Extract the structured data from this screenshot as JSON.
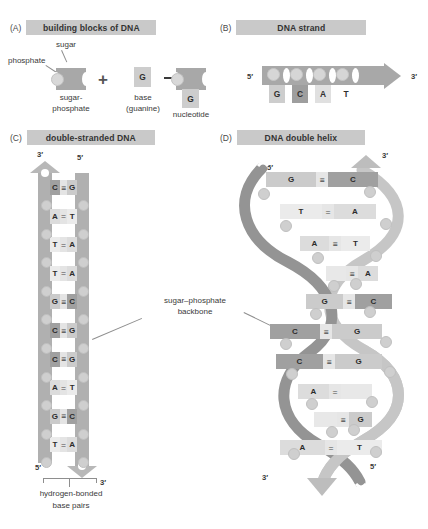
{
  "figure": {
    "panels": [
      {
        "letter": "(A)",
        "title": "building blocks of DNA"
      },
      {
        "letter": "(B)",
        "title": "DNA strand"
      },
      {
        "letter": "(C)",
        "title": "double-stranded DNA"
      },
      {
        "letter": "(D)",
        "title": "DNA double helix"
      }
    ]
  },
  "panelA": {
    "label_phosphate": "phosphate",
    "label_sugar": "sugar",
    "label_sugar_phosphate_line1": "sugar-",
    "label_sugar_phosphate_line2": "phosphate",
    "label_base_line1": "base",
    "label_base_line2": "(guanine)",
    "label_nucleotide": "nucleotide",
    "plus_sign": "+",
    "base_letter": "G",
    "product_base_letter": "G",
    "arrow_icon": "right-arrow-icon"
  },
  "panelB": {
    "five_prime": "5′",
    "three_prime": "3′",
    "bases": [
      "G",
      "C",
      "A",
      "T"
    ],
    "base_shades": [
      "#cdcdcd",
      "#9e9e9e",
      "#e0e0e0",
      "#ffffff"
    ]
  },
  "panelC": {
    "top_left_prime": "3′",
    "top_right_prime": "5′",
    "bottom_left_prime": "5′",
    "bottom_right_prime": "3′",
    "caption_line1": "hydrogen-bonded",
    "caption_line2": "base pairs",
    "base_pairs": [
      {
        "left": "C",
        "bond": "≡",
        "right": "G"
      },
      {
        "left": "A",
        "bond": "=",
        "right": "T"
      },
      {
        "left": "T",
        "bond": "=",
        "right": "A"
      },
      {
        "left": "T",
        "bond": "=",
        "right": "A"
      },
      {
        "left": "G",
        "bond": "≡",
        "right": "C"
      },
      {
        "left": "C",
        "bond": "≡",
        "right": "G"
      },
      {
        "left": "C",
        "bond": "≡",
        "right": "G"
      },
      {
        "left": "A",
        "bond": "=",
        "right": "T"
      },
      {
        "left": "G",
        "bond": "≡",
        "right": "C"
      },
      {
        "left": "T",
        "bond": "=",
        "right": "A"
      }
    ]
  },
  "panelD": {
    "top_left_prime": "5′",
    "top_right_prime": "3′",
    "bottom_left_prime": "3′",
    "bottom_right_prime": "5′",
    "base_pairs": [
      {
        "left": "G",
        "bond": "≡",
        "right": "C"
      },
      {
        "left": "T",
        "bond": "=",
        "right": "A"
      },
      {
        "left": "A",
        "bond": "≡",
        "right": "T"
      },
      {
        "left": "",
        "bond": "≡",
        "right": "A"
      },
      {
        "left": "G",
        "bond": "≡",
        "right": "C"
      },
      {
        "left": "C",
        "bond": "≡",
        "right": "G"
      },
      {
        "left": "C",
        "bond": "≡",
        "right": "G"
      },
      {
        "left": "A",
        "bond": "=",
        "right": ""
      },
      {
        "left": "",
        "bond": "≡",
        "right": "G"
      },
      {
        "left": "A",
        "bond": "=",
        "right": "T"
      }
    ]
  },
  "annotations": {
    "backbone_line1": "sugar–phosphate",
    "backbone_line2": "backbone"
  },
  "colors": {
    "header_bg": "#c9c9c9",
    "backbone_gray": "#b0b0b0",
    "ribbon_dark": "#8f8f8f",
    "ribbon_light": "#c4c4c4",
    "base_dark": "#9e9e9e",
    "base_mid": "#cdcdcd",
    "base_light": "#e2e2e2",
    "text": "#3a3a3a"
  }
}
